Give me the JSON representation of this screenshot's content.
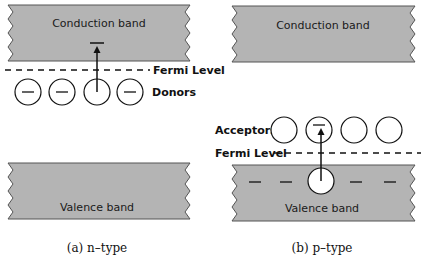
{
  "panels": {
    "n_type": {
      "conduction_band_label": "Conduction band",
      "valence_band_label": "Valence band",
      "fermi_level_label": "Fermi Level",
      "impurity_label": "Donors",
      "caption": "(a) n–type"
    },
    "p_type": {
      "conduction_band_label": "Conduction band",
      "valence_band_label": "Valence band",
      "fermi_level_label": "Fermi Level",
      "impurity_label": "Acceptors",
      "caption": "(b) p–type"
    }
  },
  "colors": {
    "band_fill": "#b4b4b4",
    "band_stroke": "#555555",
    "line": "#111111"
  }
}
